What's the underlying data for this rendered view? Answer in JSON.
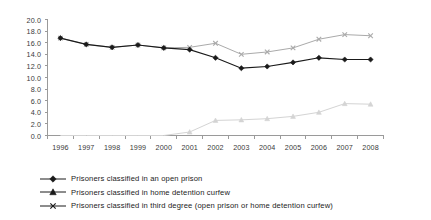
{
  "chart_data": {
    "type": "line",
    "title": "",
    "subtitle": "",
    "xlabel": "",
    "ylabel": "",
    "grid": false,
    "legend_position": "bottom-left",
    "x": [
      "1996",
      "1997",
      "1998",
      "1999",
      "2000",
      "2001",
      "2002",
      "2003",
      "2004",
      "2005",
      "2006",
      "2007",
      "2008"
    ],
    "categories": [
      "1996",
      "1997",
      "1998",
      "1999",
      "2000",
      "2001",
      "2002",
      "2003",
      "2004",
      "2005",
      "2006",
      "2007",
      "2008"
    ],
    "xlim": [
      1996,
      2008
    ],
    "ylim": [
      0.0,
      20.0
    ],
    "ytick_labels": [
      "0.0",
      "2.0",
      "4.0",
      "6.0",
      "8.0",
      "10.0",
      "12.0",
      "14.0",
      "16.0",
      "18.0",
      "20.0"
    ],
    "ytick_values": [
      0.0,
      2.0,
      4.0,
      6.0,
      8.0,
      10.0,
      12.0,
      14.0,
      16.0,
      18.0,
      20.0
    ],
    "series": [
      {
        "name": "Prisoners classified in an open prison",
        "marker": "diamond",
        "color": "#1a1a1a",
        "values": [
          16.8,
          15.7,
          15.2,
          15.6,
          15.1,
          14.8,
          13.4,
          11.6,
          11.9,
          12.6,
          13.4,
          13.1,
          13.1
        ]
      },
      {
        "name": "Prisoners classified in home detention curfew",
        "marker": "triangle",
        "color": "#d4d4d4",
        "values": [
          0.0,
          0.0,
          0.0,
          0.0,
          0.0,
          0.6,
          2.6,
          2.7,
          2.9,
          3.3,
          4.0,
          5.5,
          5.4
        ]
      },
      {
        "name": "Prisoners classified in third degree (open prison or home detention curfew)",
        "marker": "x",
        "color": "#aaaaaa",
        "values": [
          16.8,
          15.7,
          15.2,
          15.6,
          15.1,
          15.2,
          15.9,
          14.0,
          14.4,
          15.1,
          16.6,
          17.4,
          17.2
        ]
      }
    ]
  },
  "legend": {
    "items": [
      {
        "label": "Prisoners classified in an open prison",
        "marker": "diamond",
        "color": "#1a1a1a"
      },
      {
        "label": "Prisoners classified in home detention curfew",
        "marker": "triangle",
        "color": "#1a1a1a"
      },
      {
        "label": "Prisoners classified in third degree (open prison or home detention curfew)",
        "marker": "x",
        "color": "#1a1a1a"
      }
    ]
  }
}
